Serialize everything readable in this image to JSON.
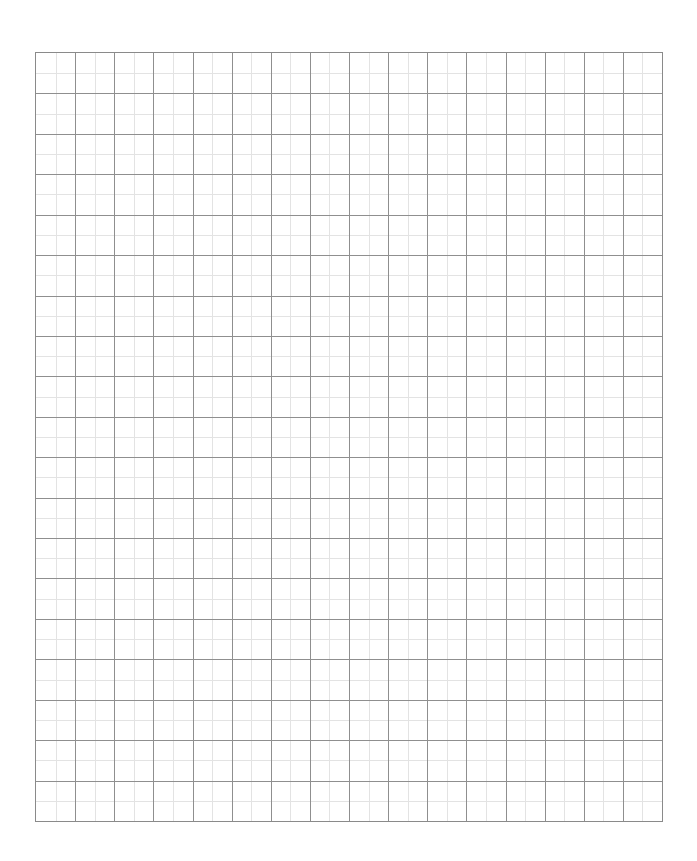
{
  "page": {
    "background": "#ffffff"
  },
  "grid": {
    "columns": 16,
    "rows": 19,
    "subdivisions": 2,
    "major_line_color": "#8f8f8f",
    "minor_line_color": "#e3e3e3",
    "border_color": "#8a8a8a"
  }
}
